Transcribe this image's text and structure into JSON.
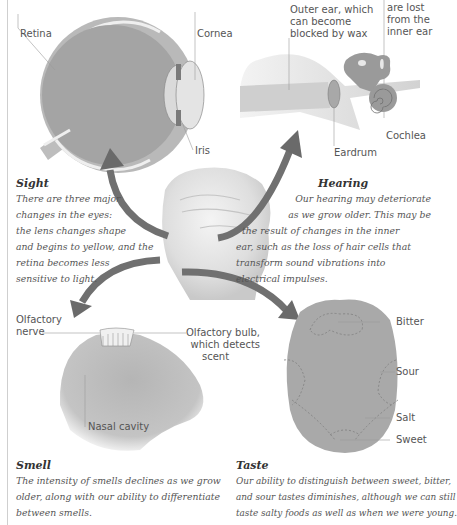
{
  "diagram": {
    "type": "anatomy-illustration",
    "center_image": "head-sculpture",
    "arrow_color": "#6f6f6f",
    "organ_fill": "#a9a9a9"
  },
  "sight": {
    "labels": {
      "retina": "Retina",
      "cornea": "Cornea",
      "iris": "Iris"
    },
    "heading": "Sight",
    "lines": [
      "There are three major",
      "changes in the eyes:",
      "the lens changes shape",
      "and begins to yellow, and the",
      "retina becomes less",
      "sensitive to light."
    ]
  },
  "hearing": {
    "labels": {
      "outer_ear": [
        "Outer ear, which",
        "can become",
        "blocked by wax"
      ],
      "hair_cells": [
        "Hair cells",
        "are lost",
        "from the",
        "inner ear"
      ],
      "eardrum": "Eardrum",
      "cochlea": "Cochlea"
    },
    "heading": "Hearing",
    "lines": [
      "Our hearing may deteriorate",
      "as we grow older. This may be",
      "the result of changes in the inner",
      "ear, such as the loss of hair cells that",
      "transform sound vibrations into",
      "electrical impulses."
    ]
  },
  "smell": {
    "labels": {
      "olfactory_nerve": [
        "Olfactory",
        "nerve"
      ],
      "olfactory_bulb": [
        "Olfactory bulb,",
        "which detects",
        "scent"
      ],
      "nasal_cavity": "Nasal cavity"
    },
    "heading": "Smell",
    "lines": [
      "The intensity of smells declines as we grow",
      "older, along with our ability to differentiate",
      "between smells."
    ]
  },
  "taste": {
    "labels": {
      "bitter": "Bitter",
      "sour": "Sour",
      "salt": "Salt",
      "sweet": "Sweet"
    },
    "heading": "Taste",
    "lines": [
      "Our ability to distinguish between sweet, bitter,",
      "and sour tastes diminishes, although we can still",
      "taste salty foods as well as when we were young."
    ]
  }
}
